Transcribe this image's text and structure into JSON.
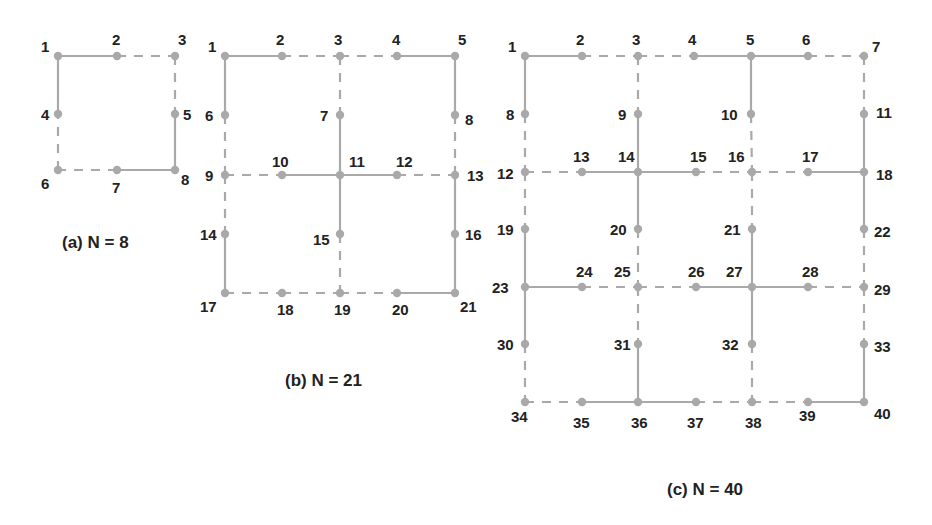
{
  "style": {
    "edge_color": "#a9a9a9",
    "node_color": "#a9a9a9",
    "text_color": "#222222"
  },
  "figures": [
    {
      "id": "a",
      "caption": "(a) N = 8",
      "caption_pos": [
        62,
        248
      ],
      "nodes": {
        "1": [
          58,
          56
        ],
        "2": [
          117,
          56
        ],
        "3": [
          175,
          56
        ],
        "4": [
          58,
          114
        ],
        "5": [
          175,
          114
        ],
        "6": [
          58,
          170
        ],
        "7": [
          117,
          170
        ],
        "8": [
          175,
          170
        ]
      },
      "labels": {
        "1": [
          41,
          52
        ],
        "2": [
          112,
          45
        ],
        "3": [
          178,
          45
        ],
        "4": [
          41,
          120
        ],
        "5": [
          183,
          120
        ],
        "6": [
          41,
          189
        ],
        "7": [
          112,
          193
        ],
        "8": [
          181,
          185
        ]
      },
      "solid": [
        [
          "1",
          "2"
        ],
        [
          "5",
          "8"
        ],
        [
          "8",
          "7"
        ],
        [
          "4",
          "1"
        ]
      ],
      "dashed": [
        [
          "2",
          "3"
        ],
        [
          "3",
          "5"
        ],
        [
          "7",
          "6"
        ],
        [
          "6",
          "4"
        ]
      ]
    },
    {
      "id": "b",
      "caption": "(b) N = 21",
      "caption_pos": [
        285,
        386
      ],
      "nodes": {
        "1": [
          225,
          56
        ],
        "2": [
          282,
          56
        ],
        "3": [
          340,
          56
        ],
        "4": [
          397,
          56
        ],
        "5": [
          455,
          56
        ],
        "6": [
          225,
          115
        ],
        "7": [
          340,
          115
        ],
        "8": [
          455,
          115
        ],
        "9": [
          225,
          175
        ],
        "10": [
          282,
          175
        ],
        "11": [
          340,
          175
        ],
        "12": [
          397,
          175
        ],
        "13": [
          455,
          175
        ],
        "14": [
          225,
          234
        ],
        "15": [
          340,
          234
        ],
        "16": [
          455,
          234
        ],
        "17": [
          225,
          293
        ],
        "18": [
          282,
          293
        ],
        "19": [
          340,
          293
        ],
        "20": [
          397,
          293
        ],
        "21": [
          455,
          293
        ]
      },
      "labels": {
        "1": [
          208,
          52
        ],
        "2": [
          276,
          45
        ],
        "3": [
          334,
          45
        ],
        "4": [
          392,
          45
        ],
        "5": [
          458,
          45
        ],
        "6": [
          205,
          121
        ],
        "7": [
          320,
          121
        ],
        "8": [
          465,
          125
        ],
        "9": [
          205,
          181
        ],
        "10": [
          272,
          167
        ],
        "11": [
          349,
          167
        ],
        "12": [
          396,
          167
        ],
        "13": [
          467,
          181
        ],
        "14": [
          200,
          240
        ],
        "15": [
          313,
          245
        ],
        "16": [
          465,
          240
        ],
        "17": [
          200,
          312
        ],
        "18": [
          277,
          315
        ],
        "19": [
          334,
          315
        ],
        "20": [
          392,
          315
        ],
        "21": [
          460,
          312
        ]
      },
      "solid": [
        [
          "1",
          "2"
        ],
        [
          "4",
          "5"
        ],
        [
          "1",
          "6"
        ],
        [
          "5",
          "8"
        ],
        [
          "7",
          "11"
        ],
        [
          "10",
          "11"
        ],
        [
          "11",
          "12"
        ],
        [
          "11",
          "15"
        ],
        [
          "14",
          "17"
        ],
        [
          "13",
          "16"
        ],
        [
          "16",
          "21"
        ],
        [
          "20",
          "21"
        ]
      ],
      "dashed": [
        [
          "2",
          "3"
        ],
        [
          "3",
          "4"
        ],
        [
          "3",
          "7"
        ],
        [
          "6",
          "9"
        ],
        [
          "8",
          "13"
        ],
        [
          "9",
          "10"
        ],
        [
          "12",
          "13"
        ],
        [
          "9",
          "14"
        ],
        [
          "15",
          "19"
        ],
        [
          "17",
          "18"
        ],
        [
          "18",
          "19"
        ],
        [
          "19",
          "20"
        ]
      ]
    },
    {
      "id": "c",
      "caption": "(c) N = 40",
      "caption_pos": [
        667,
        495
      ],
      "nodes": {
        "1": [
          525,
          56
        ],
        "2": [
          582,
          56
        ],
        "3": [
          638,
          56
        ],
        "4": [
          694,
          56
        ],
        "5": [
          751,
          56
        ],
        "6": [
          808,
          56
        ],
        "7": [
          864,
          56
        ],
        "8": [
          525,
          114
        ],
        "9": [
          638,
          114
        ],
        "10": [
          751,
          114
        ],
        "11": [
          864,
          114
        ],
        "12": [
          525,
          172
        ],
        "13": [
          582,
          172
        ],
        "14": [
          638,
          172
        ],
        "15": [
          696,
          172
        ],
        "16": [
          752,
          172
        ],
        "17": [
          808,
          172
        ],
        "18": [
          864,
          172
        ],
        "19": [
          525,
          229
        ],
        "20": [
          638,
          229
        ],
        "21": [
          752,
          229
        ],
        "22": [
          864,
          229
        ],
        "23": [
          525,
          287
        ],
        "24": [
          582,
          287
        ],
        "25": [
          638,
          287
        ],
        "26": [
          696,
          287
        ],
        "27": [
          752,
          287
        ],
        "28": [
          808,
          287
        ],
        "29": [
          864,
          287
        ],
        "30": [
          525,
          344
        ],
        "31": [
          638,
          344
        ],
        "32": [
          752,
          344
        ],
        "33": [
          864,
          344
        ],
        "34": [
          525,
          402
        ],
        "35": [
          582,
          402
        ],
        "36": [
          638,
          402
        ],
        "37": [
          696,
          402
        ],
        "38": [
          752,
          402
        ],
        "39": [
          808,
          402
        ],
        "40": [
          864,
          402
        ]
      },
      "labels": {
        "1": [
          508,
          52
        ],
        "2": [
          576,
          45
        ],
        "3": [
          632,
          45
        ],
        "4": [
          688,
          45
        ],
        "5": [
          746,
          45
        ],
        "6": [
          802,
          45
        ],
        "7": [
          872,
          52
        ],
        "8": [
          506,
          120
        ],
        "9": [
          618,
          120
        ],
        "10": [
          721,
          120
        ],
        "11": [
          876,
          118
        ],
        "12": [
          497,
          179
        ],
        "13": [
          573,
          162
        ],
        "14": [
          618,
          162
        ],
        "15": [
          690,
          162
        ],
        "16": [
          728,
          162
        ],
        "17": [
          802,
          162
        ],
        "18": [
          876,
          180
        ],
        "19": [
          497,
          235
        ],
        "20": [
          610,
          235
        ],
        "21": [
          724,
          235
        ],
        "22": [
          874,
          237
        ],
        "23": [
          492,
          293
        ],
        "24": [
          576,
          277
        ],
        "25": [
          614,
          277
        ],
        "26": [
          688,
          277
        ],
        "27": [
          726,
          277
        ],
        "28": [
          802,
          277
        ],
        "29": [
          874,
          295
        ],
        "30": [
          497,
          350
        ],
        "31": [
          614,
          350
        ],
        "32": [
          722,
          350
        ],
        "33": [
          874,
          352
        ],
        "34": [
          511,
          422
        ],
        "35": [
          573,
          428
        ],
        "36": [
          631,
          428
        ],
        "37": [
          687,
          428
        ],
        "38": [
          745,
          428
        ],
        "39": [
          799,
          421
        ],
        "40": [
          874,
          419
        ]
      },
      "solid": [
        [
          "1",
          "2"
        ],
        [
          "4",
          "5"
        ],
        [
          "5",
          "6"
        ],
        [
          "1",
          "8"
        ],
        [
          "5",
          "10"
        ],
        [
          "9",
          "14"
        ],
        [
          "11",
          "18"
        ],
        [
          "13",
          "14"
        ],
        [
          "14",
          "15"
        ],
        [
          "17",
          "18"
        ],
        [
          "14",
          "20"
        ],
        [
          "18",
          "22"
        ],
        [
          "21",
          "27"
        ],
        [
          "19",
          "23"
        ],
        [
          "23",
          "24"
        ],
        [
          "26",
          "27"
        ],
        [
          "27",
          "28"
        ],
        [
          "23",
          "30"
        ],
        [
          "27",
          "32"
        ],
        [
          "31",
          "36"
        ],
        [
          "33",
          "40"
        ],
        [
          "35",
          "36"
        ],
        [
          "36",
          "37"
        ],
        [
          "39",
          "40"
        ]
      ],
      "dashed": [
        [
          "2",
          "3"
        ],
        [
          "3",
          "4"
        ],
        [
          "6",
          "7"
        ],
        [
          "3",
          "9"
        ],
        [
          "7",
          "11"
        ],
        [
          "8",
          "12"
        ],
        [
          "10",
          "16"
        ],
        [
          "12",
          "13"
        ],
        [
          "15",
          "16"
        ],
        [
          "16",
          "17"
        ],
        [
          "12",
          "19"
        ],
        [
          "16",
          "21"
        ],
        [
          "20",
          "25"
        ],
        [
          "22",
          "29"
        ],
        [
          "24",
          "25"
        ],
        [
          "25",
          "26"
        ],
        [
          "28",
          "29"
        ],
        [
          "25",
          "31"
        ],
        [
          "29",
          "33"
        ],
        [
          "30",
          "34"
        ],
        [
          "32",
          "38"
        ],
        [
          "34",
          "35"
        ],
        [
          "37",
          "38"
        ],
        [
          "38",
          "39"
        ]
      ]
    }
  ]
}
